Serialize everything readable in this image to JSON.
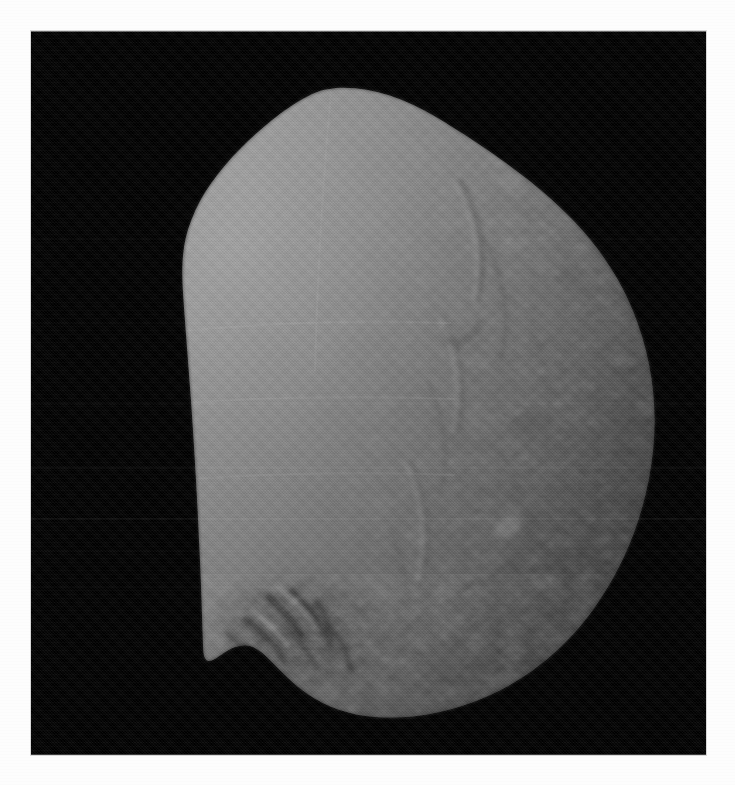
{
  "page": {
    "background_color": "#fdfdfd",
    "width": 735,
    "height": 785,
    "caption": ""
  },
  "image_frame": {
    "background_color": "#000000",
    "left": 31,
    "top": 31,
    "width": 675,
    "height": 724,
    "label": "Grayscale image of small irregular body against black sky"
  },
  "subject": {
    "name": "small-irregular-body",
    "description": "Rendered shape model / spacecraft image of an irregular rounded body, lit from the upper left with a terminator darkening toward the right limb.",
    "surface_bright_color": "#8d8d8d",
    "surface_mid_color": "#7b7b7b",
    "surface_terminator_color": "#5a5a5a",
    "surface_dark_color": "#3a3a3a",
    "space_color": "#000000"
  },
  "features": [
    {
      "name": "apex-peak",
      "label": "Angular peak at top of silhouette",
      "x": 335,
      "y": 88
    },
    {
      "name": "left-limb-bulge",
      "label": "Smooth bright left limb bulge",
      "x": 112,
      "y": 330
    },
    {
      "name": "terminator-band",
      "label": "Shading terminator across right half",
      "x": 470,
      "y": 390
    },
    {
      "name": "cratered-terrain",
      "label": "Ridged and cratered terrain on right hemisphere",
      "x": 530,
      "y": 330
    },
    {
      "name": "dark-crater-patch",
      "label": "Dark shadowed crater patch near bottom-left",
      "x": 300,
      "y": 625
    },
    {
      "name": "limb-notch",
      "label": "Concave notch in bottom-left limb",
      "x": 250,
      "y": 685
    },
    {
      "name": "small-bright-crater",
      "label": "Small crater with bright rim, mid-right",
      "x": 512,
      "y": 533
    }
  ],
  "artifacts": {
    "scan_bands_label": "Faint horizontal scan banding",
    "band_positions": [
      208,
      292,
      372,
      436,
      487,
      520,
      556
    ],
    "grain_label": "Dither / halftone grain from print scan"
  }
}
